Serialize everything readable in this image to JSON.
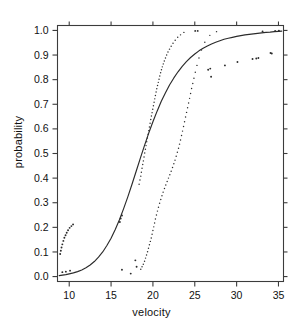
{
  "chart_data": {
    "type": "scatter",
    "title": "",
    "subtitle": "",
    "xlabel": "velocity",
    "ylabel": "probability",
    "xlim": [
      8.6,
      35.6
    ],
    "ylim": [
      -0.02,
      1.02
    ],
    "xticks": [
      10,
      15,
      20,
      25,
      30,
      35
    ],
    "xtick_labels": [
      "10",
      "15",
      "20",
      "25",
      "30",
      "35"
    ],
    "yticks": [
      0.0,
      0.1,
      0.2,
      0.3,
      0.4,
      0.5,
      0.6,
      0.7,
      0.8,
      0.9,
      1.0
    ],
    "ytick_labels": [
      "0.0",
      "0.1",
      "0.2",
      "0.3",
      "0.4",
      "0.5",
      "0.6",
      "0.7",
      "0.8",
      "0.9",
      "1.0"
    ],
    "grid": false,
    "legend": null,
    "legend_position": "none",
    "colors": {
      "curve": "#2b2b2b",
      "points": "#2b2b2b",
      "axis": "#3c3c3c",
      "background": "#ffffff"
    },
    "series": [
      {
        "name": "fitted probability curve",
        "type": "line",
        "style": "solid",
        "points": [
          [
            8.8,
            0.004
          ],
          [
            9.2,
            0.006
          ],
          [
            9.6,
            0.008
          ],
          [
            10.0,
            0.011
          ],
          [
            10.5,
            0.015
          ],
          [
            11.0,
            0.02
          ],
          [
            11.5,
            0.027
          ],
          [
            12.0,
            0.036
          ],
          [
            12.5,
            0.047
          ],
          [
            13.0,
            0.061
          ],
          [
            13.5,
            0.079
          ],
          [
            14.0,
            0.1
          ],
          [
            14.5,
            0.126
          ],
          [
            15.0,
            0.156
          ],
          [
            15.5,
            0.191
          ],
          [
            16.0,
            0.231
          ],
          [
            16.5,
            0.276
          ],
          [
            17.0,
            0.324
          ],
          [
            17.5,
            0.375
          ],
          [
            18.0,
            0.428
          ],
          [
            18.5,
            0.481
          ],
          [
            19.0,
            0.533
          ],
          [
            19.5,
            0.583
          ],
          [
            20.0,
            0.629
          ],
          [
            20.5,
            0.672
          ],
          [
            21.0,
            0.712
          ],
          [
            21.5,
            0.747
          ],
          [
            22.0,
            0.779
          ],
          [
            22.5,
            0.807
          ],
          [
            23.0,
            0.832
          ],
          [
            23.5,
            0.854
          ],
          [
            24.0,
            0.873
          ],
          [
            24.5,
            0.89
          ],
          [
            25.0,
            0.904
          ],
          [
            25.5,
            0.917
          ],
          [
            26.0,
            0.928
          ],
          [
            26.5,
            0.937
          ],
          [
            27.0,
            0.945
          ],
          [
            27.5,
            0.952
          ],
          [
            28.0,
            0.958
          ],
          [
            28.5,
            0.964
          ],
          [
            29.0,
            0.968
          ],
          [
            29.5,
            0.972
          ],
          [
            30.0,
            0.976
          ],
          [
            30.5,
            0.979
          ],
          [
            31.0,
            0.982
          ],
          [
            31.5,
            0.984
          ],
          [
            32.0,
            0.986
          ],
          [
            32.5,
            0.988
          ],
          [
            33.0,
            0.99
          ],
          [
            33.5,
            0.992
          ],
          [
            34.0,
            0.993
          ],
          [
            34.5,
            0.995
          ],
          [
            35.0,
            0.996
          ],
          [
            35.4,
            0.997
          ]
        ]
      },
      {
        "name": "left empirical band",
        "type": "dotted-points",
        "points": [
          [
            18.35,
            0.375
          ],
          [
            18.45,
            0.392
          ],
          [
            18.55,
            0.408
          ],
          [
            18.62,
            0.424
          ],
          [
            18.7,
            0.44
          ],
          [
            18.78,
            0.455
          ],
          [
            18.86,
            0.47
          ],
          [
            18.94,
            0.486
          ],
          [
            19.02,
            0.502
          ],
          [
            19.1,
            0.517
          ],
          [
            19.18,
            0.532
          ],
          [
            19.26,
            0.548
          ],
          [
            19.34,
            0.563
          ],
          [
            19.42,
            0.578
          ],
          [
            19.5,
            0.593
          ],
          [
            19.58,
            0.608
          ],
          [
            19.66,
            0.623
          ],
          [
            19.74,
            0.638
          ],
          [
            19.82,
            0.652
          ],
          [
            19.9,
            0.666
          ],
          [
            19.98,
            0.68
          ],
          [
            20.06,
            0.694
          ],
          [
            20.14,
            0.708
          ],
          [
            20.22,
            0.722
          ],
          [
            20.3,
            0.736
          ],
          [
            20.38,
            0.75
          ],
          [
            20.46,
            0.763
          ],
          [
            20.55,
            0.776
          ],
          [
            20.64,
            0.789
          ],
          [
            20.73,
            0.802
          ],
          [
            20.82,
            0.815
          ],
          [
            20.92,
            0.828
          ],
          [
            21.02,
            0.84
          ],
          [
            21.12,
            0.852
          ],
          [
            21.24,
            0.864
          ],
          [
            21.36,
            0.876
          ],
          [
            21.5,
            0.888
          ],
          [
            21.64,
            0.9
          ],
          [
            21.8,
            0.912
          ],
          [
            21.98,
            0.924
          ],
          [
            22.18,
            0.936
          ],
          [
            22.4,
            0.948
          ],
          [
            22.66,
            0.96
          ],
          [
            22.96,
            0.972
          ],
          [
            23.3,
            0.982
          ],
          [
            23.7,
            0.992
          ]
        ]
      },
      {
        "name": "right empirical band",
        "type": "dotted-points",
        "points": [
          [
            18.55,
            0.03
          ],
          [
            18.7,
            0.04
          ],
          [
            18.85,
            0.05
          ],
          [
            19.0,
            0.062
          ],
          [
            19.12,
            0.075
          ],
          [
            19.24,
            0.088
          ],
          [
            19.36,
            0.101
          ],
          [
            19.47,
            0.115
          ],
          [
            19.58,
            0.129
          ],
          [
            19.69,
            0.143
          ],
          [
            19.8,
            0.157
          ],
          [
            19.9,
            0.172
          ],
          [
            20.0,
            0.187
          ],
          [
            20.1,
            0.202
          ],
          [
            20.2,
            0.218
          ],
          [
            20.3,
            0.234
          ],
          [
            20.42,
            0.25
          ],
          [
            20.54,
            0.266
          ],
          [
            20.66,
            0.282
          ],
          [
            20.8,
            0.298
          ],
          [
            20.94,
            0.313
          ],
          [
            21.08,
            0.328
          ],
          [
            21.22,
            0.343
          ],
          [
            21.38,
            0.358
          ],
          [
            21.54,
            0.372
          ],
          [
            21.7,
            0.386
          ],
          [
            21.86,
            0.4
          ],
          [
            22.02,
            0.414
          ],
          [
            22.18,
            0.428
          ],
          [
            22.34,
            0.443
          ],
          [
            22.5,
            0.458
          ],
          [
            22.64,
            0.473
          ],
          [
            22.78,
            0.489
          ],
          [
            22.92,
            0.505
          ],
          [
            23.06,
            0.521
          ],
          [
            23.18,
            0.538
          ],
          [
            23.3,
            0.555
          ],
          [
            23.42,
            0.573
          ],
          [
            23.54,
            0.591
          ],
          [
            23.66,
            0.61
          ],
          [
            23.78,
            0.629
          ],
          [
            23.9,
            0.648
          ],
          [
            24.02,
            0.667
          ],
          [
            24.14,
            0.686
          ],
          [
            24.26,
            0.705
          ],
          [
            24.38,
            0.724
          ],
          [
            24.5,
            0.744
          ],
          [
            24.62,
            0.764
          ],
          [
            24.76,
            0.784
          ],
          [
            24.9,
            0.806
          ],
          [
            25.06,
            0.83
          ],
          [
            25.26,
            0.858
          ],
          [
            25.5,
            0.888
          ],
          [
            25.8,
            0.92
          ],
          [
            26.2,
            0.952
          ],
          [
            26.8,
            0.98
          ],
          [
            27.6,
            0.995
          ]
        ]
      },
      {
        "name": "low-velocity scatter",
        "type": "points",
        "points": [
          [
            8.92,
            0.092
          ],
          [
            9.0,
            0.105
          ],
          [
            9.08,
            0.118
          ],
          [
            9.18,
            0.131
          ],
          [
            9.3,
            0.145
          ],
          [
            9.42,
            0.158
          ],
          [
            9.56,
            0.168
          ],
          [
            9.7,
            0.178
          ],
          [
            9.86,
            0.188
          ],
          [
            10.05,
            0.198
          ],
          [
            10.26,
            0.205
          ],
          [
            10.46,
            0.212
          ],
          [
            9.18,
            0.018
          ],
          [
            9.6,
            0.02
          ],
          [
            10.1,
            0.024
          ]
        ]
      },
      {
        "name": "mid scatter outliers",
        "type": "points",
        "points": [
          [
            16.05,
            0.222
          ],
          [
            16.15,
            0.236
          ],
          [
            16.3,
            0.248
          ],
          [
            16.3,
            0.028
          ],
          [
            17.35,
            0.012
          ],
          [
            17.9,
            0.066
          ],
          [
            18.05,
            0.04
          ]
        ]
      },
      {
        "name": "high-velocity scatter",
        "type": "points",
        "points": [
          [
            25.05,
            0.998
          ],
          [
            25.35,
            0.998
          ],
          [
            26.6,
            0.84
          ],
          [
            26.85,
            0.845
          ],
          [
            26.95,
            0.812
          ],
          [
            28.6,
            0.858
          ],
          [
            30.1,
            0.872
          ],
          [
            31.9,
            0.884
          ],
          [
            32.35,
            0.886
          ],
          [
            32.6,
            0.888
          ],
          [
            34.05,
            0.908
          ],
          [
            34.2,
            0.906
          ],
          [
            33.1,
            0.996
          ],
          [
            34.6,
            0.998
          ],
          [
            35.05,
            0.999
          ]
        ]
      }
    ]
  },
  "axes": {
    "x_title": "velocity",
    "y_title": "probability"
  }
}
